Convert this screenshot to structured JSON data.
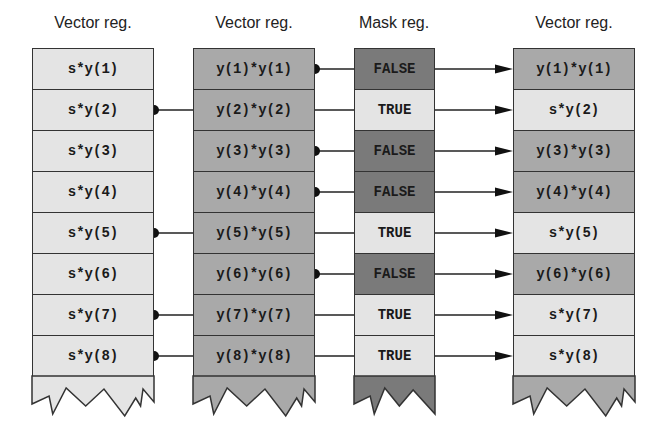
{
  "colors": {
    "light": "#e4e4e4",
    "medium": "#a9a9a9",
    "dark": "#7a7a7a",
    "border": "#333333",
    "line": "#222222"
  },
  "columns": [
    {
      "title": "Vector reg.",
      "role": "source-a",
      "cells": [
        "s*y(1)",
        "s*y(2)",
        "s*y(3)",
        "s*y(4)",
        "s*y(5)",
        "s*y(6)",
        "s*y(7)",
        "s*y(8)"
      ],
      "shade": [
        "light",
        "light",
        "light",
        "light",
        "light",
        "light",
        "light",
        "light"
      ],
      "tail_shade": "light"
    },
    {
      "title": "Vector reg.",
      "role": "source-b",
      "cells": [
        "y(1)*y(1)",
        "y(2)*y(2)",
        "y(3)*y(3)",
        "y(4)*y(4)",
        "y(5)*y(5)",
        "y(6)*y(6)",
        "y(7)*y(7)",
        "y(8)*y(8)"
      ],
      "shade": [
        "medium",
        "medium",
        "medium",
        "medium",
        "medium",
        "medium",
        "medium",
        "medium"
      ],
      "tail_shade": "medium"
    },
    {
      "title": "Mask reg.",
      "role": "mask",
      "cells": [
        "FALSE",
        "TRUE",
        "FALSE",
        "FALSE",
        "TRUE",
        "FALSE",
        "TRUE",
        "TRUE"
      ],
      "shade": [
        "dark",
        "light",
        "dark",
        "dark",
        "light",
        "dark",
        "light",
        "light"
      ],
      "tail_shade": "dark"
    },
    {
      "title": "Vector reg.",
      "role": "result",
      "cells": [
        "y(1)*y(1)",
        "s*y(2)",
        "y(3)*y(3)",
        "y(4)*y(4)",
        "s*y(5)",
        "y(6)*y(6)",
        "s*y(7)",
        "s*y(8)"
      ],
      "shade": [
        "medium",
        "light",
        "medium",
        "medium",
        "light",
        "medium",
        "light",
        "light"
      ],
      "tail_shade": "medium"
    }
  ],
  "connections": {
    "from_source_a_rows": [
      2,
      5,
      7,
      8
    ],
    "from_source_b_rows": [
      1,
      3,
      4,
      6
    ],
    "mask_to_result_rows": [
      1,
      2,
      3,
      4,
      5,
      6,
      7,
      8
    ]
  }
}
